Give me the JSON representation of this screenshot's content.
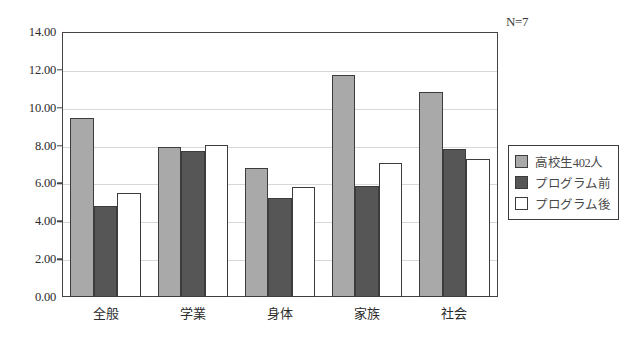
{
  "chart_data": {
    "type": "bar",
    "title": "",
    "subtitle": "",
    "xlabel": "",
    "ylabel": "",
    "annotation": "N=7",
    "categories": [
      "全般",
      "学業",
      "身体",
      "家族",
      "社会"
    ],
    "series": [
      {
        "name": "高校生402人",
        "color": "#a9a9a9",
        "values": [
          9.45,
          7.9,
          6.8,
          11.75,
          10.85
        ]
      },
      {
        "name": "プログラム前",
        "color": "#565656",
        "values": [
          4.8,
          7.7,
          5.25,
          5.85,
          7.8
        ]
      },
      {
        "name": "プログラム後",
        "color": "#ffffff",
        "values": [
          5.5,
          8.05,
          5.8,
          7.1,
          7.3
        ]
      }
    ],
    "ylim": [
      0,
      14
    ],
    "ytick_step": 2,
    "ytick_labels": [
      "0.00",
      "2.00",
      "4.00",
      "6.00",
      "8.00",
      "10.00",
      "12.00",
      "14.00"
    ],
    "ytick_values": [
      0,
      2,
      4,
      6,
      8,
      10,
      12,
      14
    ],
    "grid": true,
    "legend_position": "right"
  }
}
